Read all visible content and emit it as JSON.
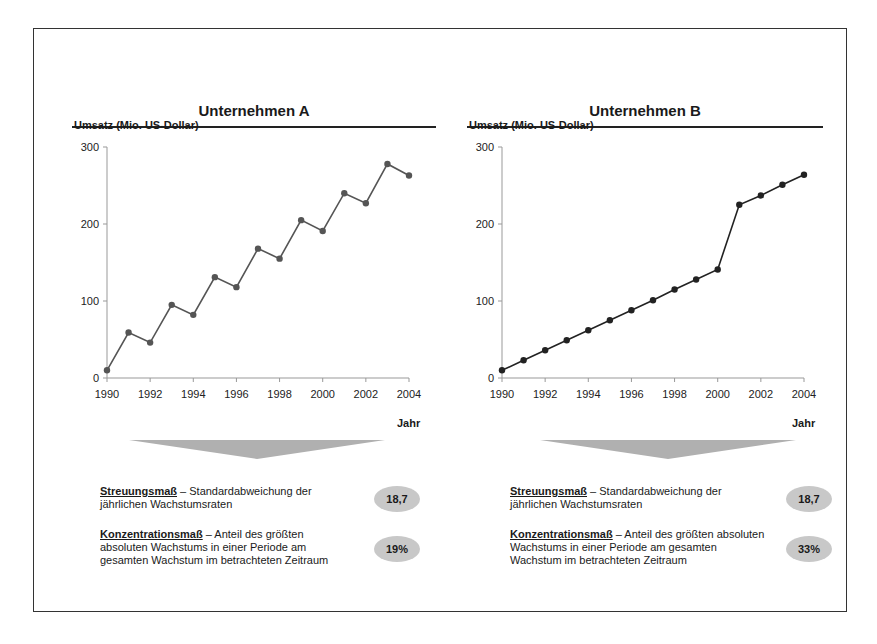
{
  "panels": [
    {
      "title": "Unternehmen A",
      "y_axis_label": "Umsatz (Mio. US-Dollar)",
      "x_axis_label": "Jahr",
      "y_ticks": [
        "0",
        "100",
        "200",
        "300"
      ],
      "x_ticks": [
        "1990",
        "1992",
        "1994",
        "1996",
        "1998",
        "2000",
        "2002",
        "2004"
      ],
      "measures": [
        {
          "term": "Streuungsmaß",
          "description": " – Standardabweichung der jährlichen Wachstumsraten",
          "value": "18,7"
        },
        {
          "term": "Konzentrationsmaß",
          "description": " – Anteil des größten absoluten Wachstums in einer Periode am gesamten Wachstum im betrachteten Zeitraum",
          "value": "19%"
        }
      ]
    },
    {
      "title": "Unternehmen B",
      "y_axis_label": "Umsatz (Mio. US-Dollar)",
      "x_axis_label": "Jahr",
      "y_ticks": [
        "0",
        "100",
        "200",
        "300"
      ],
      "x_ticks": [
        "1990",
        "1992",
        "1994",
        "1996",
        "1998",
        "2000",
        "2002",
        "2004"
      ],
      "measures": [
        {
          "term": "Streuungsmaß",
          "description": " – Standardabweichung der jährlichen Wachstumsraten",
          "value": "18,7"
        },
        {
          "term": "Konzentrationsmaß",
          "description": " – Anteil des größten absoluten Wachstums in einer Periode am gesamten Wachstum im betrachteten Zeitraum",
          "value": "33%"
        }
      ]
    }
  ],
  "colors": {
    "line_a": "#555555",
    "line_b": "#222222",
    "oval": "#c8c8c8",
    "arrow": "#b0b0b0"
  },
  "chart_data": [
    {
      "type": "line",
      "title": "Unternehmen A",
      "xlabel": "Jahr",
      "ylabel": "Umsatz (Mio. US-Dollar)",
      "ylim": [
        0,
        300
      ],
      "grid": false,
      "x": [
        1990,
        1991,
        1992,
        1993,
        1994,
        1995,
        1996,
        1997,
        1998,
        1999,
        2000,
        2001,
        2002,
        2003,
        2004
      ],
      "series": [
        {
          "name": "Umsatz",
          "values": [
            10,
            59,
            46,
            95,
            82,
            131,
            118,
            168,
            155,
            205,
            191,
            240,
            227,
            278,
            263
          ]
        }
      ]
    },
    {
      "type": "line",
      "title": "Unternehmen B",
      "xlabel": "Jahr",
      "ylabel": "Umsatz (Mio. US-Dollar)",
      "ylim": [
        0,
        300
      ],
      "grid": false,
      "x": [
        1990,
        1991,
        1992,
        1993,
        1994,
        1995,
        1996,
        1997,
        1998,
        1999,
        2000,
        2001,
        2002,
        2003,
        2004
      ],
      "series": [
        {
          "name": "Umsatz",
          "values": [
            10,
            23,
            36,
            49,
            62,
            75,
            88,
            101,
            115,
            128,
            141,
            225,
            237,
            251,
            264
          ]
        }
      ]
    }
  ]
}
